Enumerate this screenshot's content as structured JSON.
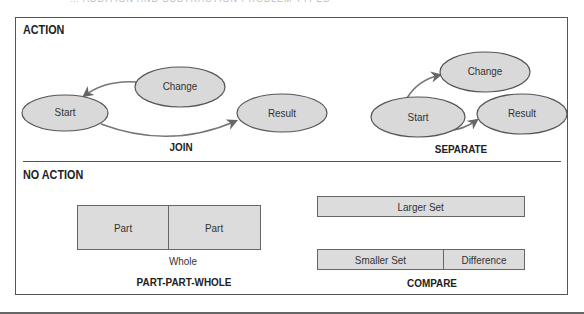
{
  "header": {
    "title_cut": "… ADDITION AND SUBTRACTION PROBLEM TYPES"
  },
  "action_section": {
    "label": "ACTION",
    "join": {
      "caption": "JOIN",
      "nodes": {
        "start": "Start",
        "change": "Change",
        "result": "Result"
      }
    },
    "separate": {
      "caption": "SEPARATE",
      "nodes": {
        "start": "Start",
        "change": "Change",
        "result": "Result"
      }
    }
  },
  "no_action_section": {
    "label": "NO ACTION",
    "part_part_whole": {
      "caption": "PART-PART-WHOLE",
      "part1": "Part",
      "part2": "Part",
      "whole": "Whole"
    },
    "compare": {
      "caption": "COMPARE",
      "larger_set": "Larger Set",
      "smaller_set": "Smaller Set",
      "difference": "Difference"
    }
  },
  "colors": {
    "node_fill": "#d9d9d9",
    "node_stroke": "#555555",
    "arrow": "#666666",
    "frame": "#555555"
  }
}
